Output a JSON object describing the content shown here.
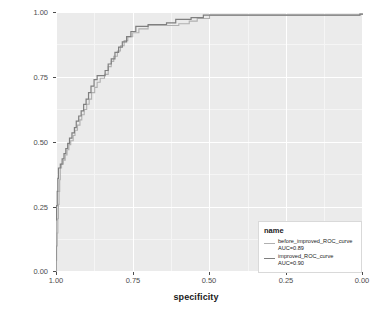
{
  "chart_data": {
    "type": "line",
    "title": "",
    "xlabel": "specificity",
    "ylabel": "sensitivity",
    "xlim": [
      1.0,
      0.0
    ],
    "ylim": [
      0.0,
      1.0
    ],
    "x_reversed": true,
    "grid": true,
    "legend_position": "bottom-right",
    "legend_title": "name",
    "xticks": [
      "1.00",
      "0.75",
      "0.50",
      "0.25",
      "0.00"
    ],
    "xtick_values": [
      1.0,
      0.75,
      0.5,
      0.25,
      0.0
    ],
    "yticks": [
      "0.00",
      "0.25",
      "0.50",
      "0.75",
      "1.00"
    ],
    "ytick_values": [
      0.0,
      0.25,
      0.5,
      0.75,
      1.0
    ],
    "series": [
      {
        "name": "before_improved_ROC_curve",
        "label": "before_improved_ROC_curve",
        "auc_label": "AUC=0.89",
        "auc": 0.89,
        "color": "#b0b0b0",
        "points": [
          [
            1.0,
            0.0
          ],
          [
            1.0,
            0.045
          ],
          [
            0.998,
            0.045
          ],
          [
            0.998,
            0.1
          ],
          [
            0.996,
            0.1
          ],
          [
            0.996,
            0.15
          ],
          [
            0.994,
            0.15
          ],
          [
            0.994,
            0.205
          ],
          [
            0.992,
            0.205
          ],
          [
            0.992,
            0.26
          ],
          [
            0.99,
            0.26
          ],
          [
            0.99,
            0.31
          ],
          [
            0.988,
            0.31
          ],
          [
            0.988,
            0.355
          ],
          [
            0.986,
            0.355
          ],
          [
            0.986,
            0.4
          ],
          [
            0.982,
            0.4
          ],
          [
            0.982,
            0.415
          ],
          [
            0.976,
            0.415
          ],
          [
            0.976,
            0.43
          ],
          [
            0.97,
            0.43
          ],
          [
            0.97,
            0.45
          ],
          [
            0.964,
            0.45
          ],
          [
            0.964,
            0.47
          ],
          [
            0.958,
            0.47
          ],
          [
            0.958,
            0.49
          ],
          [
            0.952,
            0.49
          ],
          [
            0.952,
            0.505
          ],
          [
            0.944,
            0.505
          ],
          [
            0.944,
            0.525
          ],
          [
            0.938,
            0.525
          ],
          [
            0.938,
            0.545
          ],
          [
            0.93,
            0.545
          ],
          [
            0.93,
            0.565
          ],
          [
            0.922,
            0.565
          ],
          [
            0.922,
            0.585
          ],
          [
            0.916,
            0.585
          ],
          [
            0.916,
            0.605
          ],
          [
            0.908,
            0.605
          ],
          [
            0.908,
            0.625
          ],
          [
            0.9,
            0.625
          ],
          [
            0.9,
            0.645
          ],
          [
            0.892,
            0.645
          ],
          [
            0.892,
            0.665
          ],
          [
            0.884,
            0.665
          ],
          [
            0.884,
            0.69
          ],
          [
            0.874,
            0.69
          ],
          [
            0.874,
            0.71
          ],
          [
            0.866,
            0.71
          ],
          [
            0.866,
            0.73
          ],
          [
            0.856,
            0.73
          ],
          [
            0.856,
            0.745
          ],
          [
            0.842,
            0.745
          ],
          [
            0.842,
            0.76
          ],
          [
            0.83,
            0.76
          ],
          [
            0.83,
            0.79
          ],
          [
            0.82,
            0.79
          ],
          [
            0.82,
            0.81
          ],
          [
            0.812,
            0.81
          ],
          [
            0.812,
            0.83
          ],
          [
            0.8,
            0.83
          ],
          [
            0.8,
            0.85
          ],
          [
            0.79,
            0.85
          ],
          [
            0.79,
            0.87
          ],
          [
            0.778,
            0.87
          ],
          [
            0.778,
            0.89
          ],
          [
            0.766,
            0.89
          ],
          [
            0.766,
            0.905
          ],
          [
            0.75,
            0.905
          ],
          [
            0.75,
            0.92
          ],
          [
            0.73,
            0.92
          ],
          [
            0.73,
            0.935
          ],
          [
            0.7,
            0.935
          ],
          [
            0.7,
            0.948
          ],
          [
            0.6,
            0.948
          ],
          [
            0.6,
            0.955
          ],
          [
            0.566,
            0.955
          ],
          [
            0.566,
            0.965
          ],
          [
            0.54,
            0.965
          ],
          [
            0.54,
            0.975
          ],
          [
            0.5,
            0.975
          ],
          [
            0.5,
            0.988
          ],
          [
            0.01,
            0.988
          ],
          [
            0.01,
            0.992
          ],
          [
            0.0,
            0.992
          ]
        ]
      },
      {
        "name": "improved_ROC_curve",
        "label": "improved_ROC_curve",
        "auc_label": "AUC=0.90",
        "auc": 0.9,
        "color": "#7f7f7f",
        "points": [
          [
            1.0,
            0.0
          ],
          [
            1.0,
            0.055
          ],
          [
            1.0,
            0.2
          ],
          [
            0.998,
            0.2
          ],
          [
            0.998,
            0.255
          ],
          [
            0.996,
            0.255
          ],
          [
            0.996,
            0.31
          ],
          [
            0.994,
            0.31
          ],
          [
            0.994,
            0.36
          ],
          [
            0.992,
            0.36
          ],
          [
            0.992,
            0.4
          ],
          [
            0.986,
            0.4
          ],
          [
            0.986,
            0.415
          ],
          [
            0.98,
            0.415
          ],
          [
            0.98,
            0.435
          ],
          [
            0.974,
            0.435
          ],
          [
            0.974,
            0.455
          ],
          [
            0.968,
            0.455
          ],
          [
            0.968,
            0.475
          ],
          [
            0.962,
            0.475
          ],
          [
            0.962,
            0.495
          ],
          [
            0.956,
            0.495
          ],
          [
            0.956,
            0.515
          ],
          [
            0.948,
            0.515
          ],
          [
            0.948,
            0.535
          ],
          [
            0.94,
            0.535
          ],
          [
            0.94,
            0.555
          ],
          [
            0.934,
            0.555
          ],
          [
            0.934,
            0.58
          ],
          [
            0.926,
            0.58
          ],
          [
            0.926,
            0.6
          ],
          [
            0.918,
            0.6
          ],
          [
            0.918,
            0.62
          ],
          [
            0.91,
            0.62
          ],
          [
            0.91,
            0.645
          ],
          [
            0.902,
            0.645
          ],
          [
            0.902,
            0.665
          ],
          [
            0.894,
            0.665
          ],
          [
            0.894,
            0.69
          ],
          [
            0.886,
            0.69
          ],
          [
            0.886,
            0.715
          ],
          [
            0.876,
            0.715
          ],
          [
            0.876,
            0.74
          ],
          [
            0.866,
            0.74
          ],
          [
            0.866,
            0.755
          ],
          [
            0.84,
            0.755
          ],
          [
            0.84,
            0.775
          ],
          [
            0.83,
            0.775
          ],
          [
            0.83,
            0.8
          ],
          [
            0.82,
            0.8
          ],
          [
            0.82,
            0.82
          ],
          [
            0.808,
            0.82
          ],
          [
            0.808,
            0.845
          ],
          [
            0.796,
            0.845
          ],
          [
            0.796,
            0.865
          ],
          [
            0.784,
            0.865
          ],
          [
            0.784,
            0.885
          ],
          [
            0.77,
            0.885
          ],
          [
            0.77,
            0.905
          ],
          [
            0.756,
            0.905
          ],
          [
            0.756,
            0.925
          ],
          [
            0.74,
            0.925
          ],
          [
            0.74,
            0.945
          ],
          [
            0.7,
            0.945
          ],
          [
            0.7,
            0.952
          ],
          [
            0.64,
            0.952
          ],
          [
            0.64,
            0.958
          ],
          [
            0.61,
            0.958
          ],
          [
            0.61,
            0.972
          ],
          [
            0.56,
            0.972
          ],
          [
            0.56,
            0.978
          ],
          [
            0.52,
            0.978
          ],
          [
            0.52,
            0.988
          ],
          [
            0.01,
            0.988
          ],
          [
            0.01,
            0.992
          ],
          [
            0.0,
            0.992
          ]
        ]
      }
    ]
  },
  "legend": {
    "title": "name",
    "entries": [
      {
        "label": "before_improved_ROC_curve",
        "auc_label": "AUC=0.89",
        "color": "#b0b0b0"
      },
      {
        "label": "improved_ROC_curve",
        "auc_label": "AUC=0.90",
        "color": "#7f7f7f"
      }
    ]
  },
  "axes": {
    "x_title": "specificity",
    "y_title": "sensitivity",
    "x_ticks": [
      "1.00",
      "0.75",
      "0.50",
      "0.25",
      "0.00"
    ],
    "y_ticks": [
      "1.00",
      "0.75",
      "0.50",
      "0.25",
      "0.00"
    ]
  },
  "colors": {
    "panel_background": "#ebebeb",
    "grid_major": "#ffffff",
    "grid_minor": "#f5f5f5",
    "text": "#1a1a1a",
    "tick_text": "#4d4d4d",
    "page_background": "#ffffff"
  }
}
